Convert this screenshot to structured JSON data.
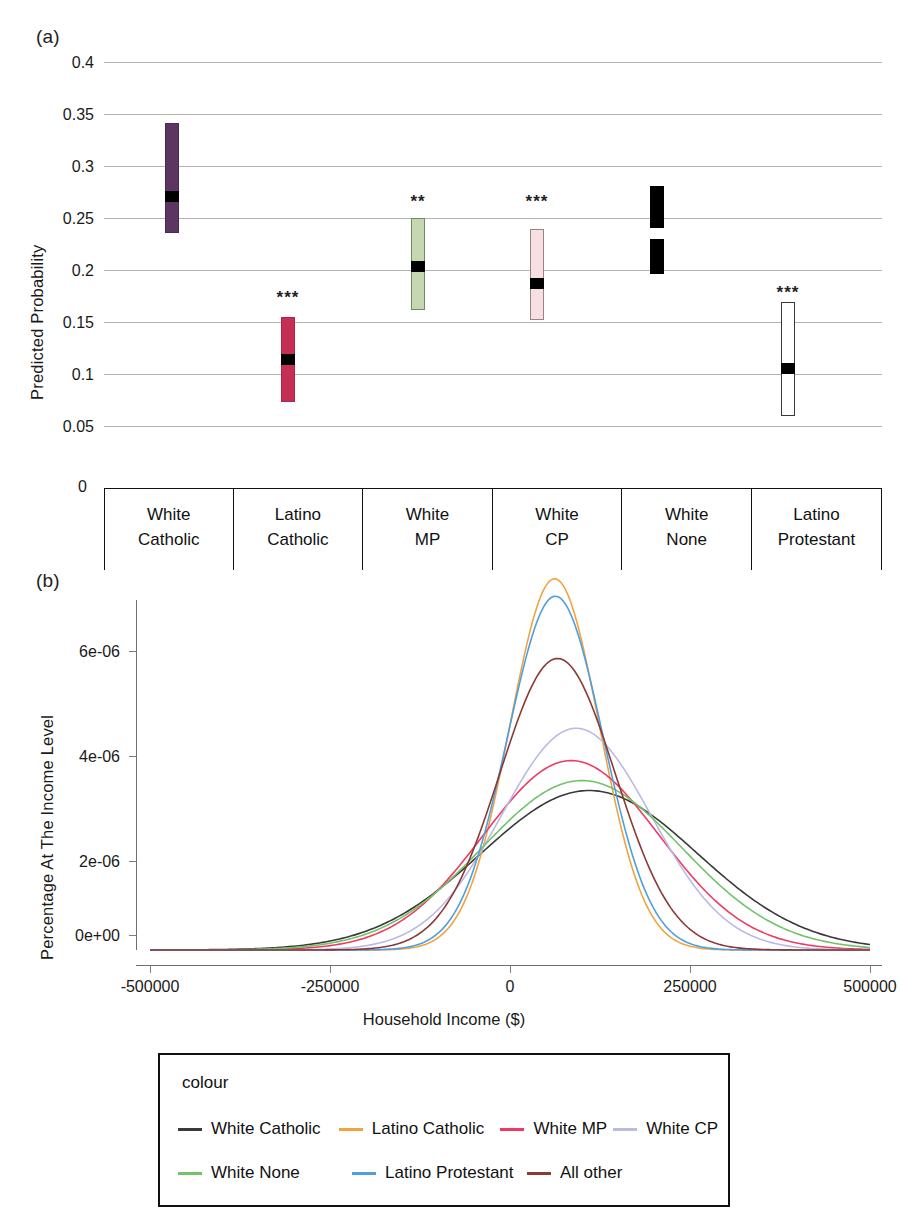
{
  "figure": {
    "panel_a_tag": "(a)",
    "panel_b_tag": "(b)"
  },
  "panel_a": {
    "ylabel": "Predicted Probability",
    "yticks": [
      "0.4",
      "0.35",
      "0.3",
      "0.25",
      "0.2",
      "0.15",
      "0.1",
      "0.05",
      "0"
    ],
    "zero_label": "0",
    "categories": [
      {
        "line1": "White",
        "line2": "Catholic"
      },
      {
        "line1": "Latino",
        "line2": "Catholic"
      },
      {
        "line1": "White",
        "line2": "MP"
      },
      {
        "line1": "White",
        "line2": "CP"
      },
      {
        "line1": "White",
        "line2": "None"
      },
      {
        "line1": "Latino",
        "line2": "Protestant"
      }
    ]
  },
  "panel_b": {
    "ylabel": "Percentage At The Income Level",
    "xlabel": "Household Income ($)",
    "yticks": [
      "6e-06",
      "4e-06",
      "2e-06",
      "0e+00"
    ],
    "xticks": [
      "-500000",
      "-250000",
      "0",
      "250000",
      "500000"
    ]
  },
  "legend": {
    "title": "colour",
    "rows": [
      [
        {
          "label": "White Catholic",
          "color": "#3a3a3a"
        },
        {
          "label": "Latino Catholic",
          "color": "#f2a340"
        },
        {
          "label": "White MP",
          "color": "#ef3b63"
        },
        {
          "label": "White CP",
          "color": "#b9bbe4"
        }
      ],
      [
        {
          "label": "White None",
          "color": "#73c36b"
        },
        {
          "label": "Latino Protestant",
          "color": "#4e9fe0"
        },
        {
          "label": "All other",
          "color": "#8c3a35"
        }
      ]
    ]
  },
  "chart_data": [
    {
      "type": "bar",
      "id": "panel-a-predicted-probability",
      "title": "(a)",
      "xlabel": "",
      "ylabel": "Predicted Probability",
      "ylim": [
        0,
        0.4
      ],
      "yticks": [
        0,
        0.05,
        0.1,
        0.15,
        0.2,
        0.25,
        0.3,
        0.35,
        0.4
      ],
      "grid": true,
      "categories": [
        "White Catholic",
        "Latino Catholic",
        "White MP",
        "White CP",
        "White None",
        "Latino Protestant"
      ],
      "values": [
        0.28,
        0.115,
        0.204,
        0.196,
        0.236,
        0.113
      ],
      "ci_low": [
        0.228,
        0.074,
        0.161,
        0.152,
        0.194,
        0.06
      ],
      "ci_high": [
        0.337,
        0.155,
        0.25,
        0.239,
        0.279,
        0.17
      ],
      "significance": [
        "",
        "***",
        "**",
        "***",
        "",
        "***"
      ],
      "bar_fill": [
        "#5d3563",
        "#c52f56",
        "#c6d7b4",
        "#f6e0e2",
        "#000000",
        "#ffffff"
      ],
      "bar_stroke": [
        "#4a2a50",
        "#a8274a",
        "#6f8a5c",
        "#9a7e82",
        "#000000",
        "#3a3a3a"
      ],
      "point_color": [
        "#000000",
        "#000000",
        "#000000",
        "#000000",
        "#ffffff",
        "#000000"
      ]
    },
    {
      "type": "line",
      "id": "panel-b-income-density",
      "title": "(b)",
      "xlabel": "Household Income ($)",
      "ylabel": "Percentage At The Income Level",
      "xlim": [
        -500000,
        500000
      ],
      "ylim": [
        0,
        7.6e-06
      ],
      "xticks": [
        -500000,
        -250000,
        0,
        250000,
        500000
      ],
      "yticks": [
        0,
        2e-06,
        4e-06,
        6e-06
      ],
      "grid": false,
      "legend_position": "bottom",
      "legend_title": "colour",
      "series": [
        {
          "name": "White Catholic",
          "color": "#3a3a3a",
          "peak_x": 110000,
          "peak_y": 3.2e-06,
          "sd": 150000
        },
        {
          "name": "Latino Catholic",
          "color": "#f2a340",
          "peak_x": 62000,
          "peak_y": 7.45e-06,
          "sd": 62000
        },
        {
          "name": "White MP",
          "color": "#ef3b63",
          "peak_x": 85000,
          "peak_y": 3.8e-06,
          "sd": 122000
        },
        {
          "name": "White CP",
          "color": "#b9bbe4",
          "peak_x": 92000,
          "peak_y": 4.45e-06,
          "sd": 104000
        },
        {
          "name": "White None",
          "color": "#73c36b",
          "peak_x": 100000,
          "peak_y": 3.4e-06,
          "sd": 138000
        },
        {
          "name": "Latino Protestant",
          "color": "#4e9fe0",
          "peak_x": 63000,
          "peak_y": 7.1e-06,
          "sd": 66000
        },
        {
          "name": "All other",
          "color": "#8c3a35",
          "peak_x": 66000,
          "peak_y": 5.85e-06,
          "sd": 80000
        }
      ]
    }
  ]
}
